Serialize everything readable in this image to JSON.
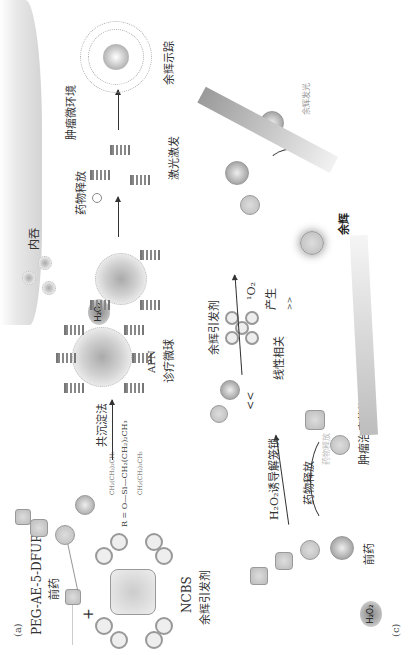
{
  "figure": {
    "orientation": "rotated 90 degrees counter-clockwise",
    "panels": {
      "a": {
        "tag": "(a)",
        "prodrug_name": "PEG-AE-5-DFUR",
        "prodrug_label": "前药",
        "plus": "+",
        "photosensitizer_name": "NCBS",
        "photosensitizer_label": "余辉引发剂",
        "r_group_formula": "R = O—Si—CH₂(CH₂)₂CH₃",
        "r_group_top": "CH₂(CH₂)₂CH₃",
        "r_group_bottom": "CH₂(CH₂)₂CH₃",
        "arrow_label": "共沉淀法",
        "product_name": "APN",
        "product_label": "诊疗微球"
      },
      "b": {
        "tag": "(b)",
        "h2o": "H₂O₂",
        "endocytosis": "内吞",
        "drug_release": "药物释放",
        "laser": "激光激发",
        "microenvironment": "肿瘤微环境",
        "afterglow_imaging": "余辉示踪"
      },
      "c": {
        "tag": "(c)",
        "h2o": "H₂O₂",
        "prodrug_label": "前药",
        "oxidation_label": "H₂O₂诱导解笼锁",
        "drug_release": "药物释放",
        "drug_label": "肿瘤治疗药物",
        "initiator_label": "余辉引发剂",
        "singlet_oxygen": "¹O₂",
        "singlet_oxygen_produce": "产生",
        "linear_relation": "线性相关",
        "afterglow_label": "余辉",
        "afterglow_emission": "余辉发光",
        "drug_release_faint": "药物释放",
        "gt_sign": ">>",
        "lt_sign": "<<"
      }
    }
  }
}
